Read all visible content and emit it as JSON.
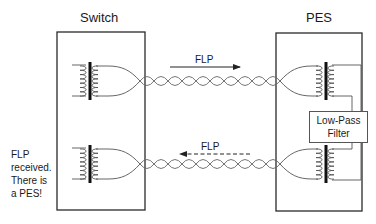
{
  "diagram": {
    "switch_label": "Switch",
    "pes_label": "PES",
    "top_arrow": {
      "label": "FLP",
      "direction": "right",
      "style": "solid"
    },
    "bottom_arrow": {
      "label": "FLP",
      "direction": "left",
      "style": "dashed"
    },
    "filter": {
      "line1": "Low-Pass",
      "line2": "Filter"
    },
    "note": {
      "line1": "FLP",
      "line2": "received.",
      "line3": "There is",
      "line4": "a PES!"
    },
    "colors": {
      "line": "#2a2a2a",
      "wire": "#666666",
      "core": "#111111",
      "background": "#ffffff"
    }
  }
}
